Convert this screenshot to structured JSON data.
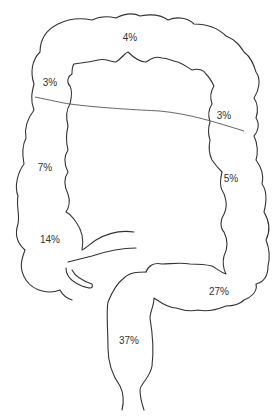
{
  "diagram": {
    "colors": {
      "stroke": "#333333",
      "text": "#333333",
      "background": "#ffffff"
    },
    "labels": [
      {
        "id": "transverse",
        "text": "4%",
        "x": 130,
        "y": 38
      },
      {
        "id": "hepatic-flexure",
        "text": "3%",
        "x": 50,
        "y": 83
      },
      {
        "id": "splenic-flexure",
        "text": "3%",
        "x": 224,
        "y": 116
      },
      {
        "id": "ascending",
        "text": "7%",
        "x": 45,
        "y": 168
      },
      {
        "id": "descending",
        "text": "5%",
        "x": 231,
        "y": 179
      },
      {
        "id": "cecum",
        "text": "14%",
        "x": 50,
        "y": 240
      },
      {
        "id": "sigmoid",
        "text": "27%",
        "x": 219,
        "y": 292
      },
      {
        "id": "rectum",
        "text": "37%",
        "x": 129,
        "y": 341
      }
    ]
  }
}
